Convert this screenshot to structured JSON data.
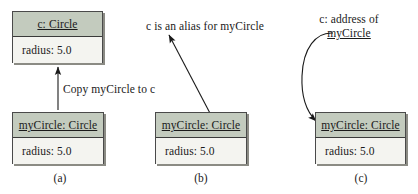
{
  "figure": {
    "colors": {
      "header_fill": "#c3cbbe",
      "body_fill": "#f4f4f0",
      "border": "#4a4a4a",
      "shadow": "#8b8b84",
      "text": "#1a1a1a",
      "arrow": "#1a1a1a",
      "background": "#ffffff"
    }
  },
  "panels": [
    {
      "id": "a",
      "caption": "(a)",
      "boxes": [
        {
          "id": "c-circle",
          "header": "c: Circle",
          "body": "radius: 5.0"
        },
        {
          "id": "mycircle-circle",
          "header": "myCircle: Circle",
          "body": "radius: 5.0"
        }
      ],
      "annotation": "Copy myCircle to c",
      "arrow": {
        "type": "straight-up",
        "label": "Copy myCircle to c"
      }
    },
    {
      "id": "b",
      "caption": "(b)",
      "boxes": [
        {
          "id": "mycircle-circle",
          "header": "myCircle: Circle",
          "body": "radius: 5.0"
        }
      ],
      "annotation": "c is an alias for myCircle",
      "arrow": {
        "type": "straight-diagonal",
        "label": "c is an alias for myCircle"
      }
    },
    {
      "id": "c",
      "caption": "(c)",
      "boxes": [
        {
          "id": "mycircle-circle",
          "header": "myCircle: Circle",
          "body": "radius: 5.0"
        }
      ],
      "annotation_line1": "c: address of",
      "annotation_line2": "myCircle",
      "arrow": {
        "type": "curved",
        "label": "c: address of myCircle"
      }
    }
  ]
}
